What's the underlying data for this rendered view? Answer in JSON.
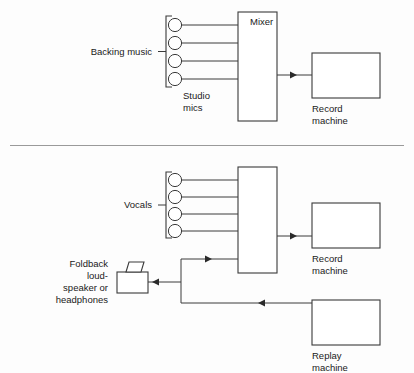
{
  "figure": {
    "background_color": "#fdfdfd",
    "line_color": "#3a3a3a",
    "text_color": "#1a1a1a",
    "divider_color": "#9a9a9a"
  },
  "panels": [
    {
      "id": "panel-top",
      "name": "backing-music-session",
      "labels": {
        "source": "Backing music",
        "mics": "Studio\nmics",
        "mics_line1": "Studio",
        "mics_line2": "mics",
        "mixer": "Mixer",
        "record_line1": "Record",
        "record_line2": "machine"
      },
      "mic_count": 4
    },
    {
      "id": "panel-bottom",
      "name": "vocal-overdub-session",
      "labels": {
        "source": "Vocals",
        "mixer": "",
        "record_line1": "Record",
        "record_line2": "machine",
        "replay_line1": "Replay",
        "replay_line2": "machine",
        "foldback_line1": "Foldback",
        "foldback_line2": "loud-",
        "foldback_line3": "speaker or",
        "foldback_line4": "headphones"
      },
      "mic_count": 4
    }
  ],
  "nodes": {
    "top_mixer": {
      "label": "Mixer"
    },
    "top_record": {
      "label_line1": "Record",
      "label_line2": "machine"
    },
    "bottom_mixer": {
      "label": ""
    },
    "bottom_record": {
      "label_line1": "Record",
      "label_line2": "machine"
    },
    "bottom_replay": {
      "label_line1": "Replay",
      "label_line2": "machine"
    },
    "foldback_speaker": {
      "label_line1": "Foldback",
      "label_line2": "loud-",
      "label_line3": "speaker or",
      "label_line4": "headphones"
    }
  }
}
